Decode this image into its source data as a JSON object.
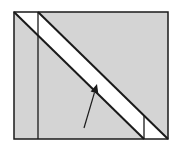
{
  "diagram": {
    "type": "geometry",
    "colors": {
      "background": "#ffffff",
      "shaded_region": "#d4d4d4",
      "band": "#ffffff",
      "stroke": "#1a1a1a"
    },
    "rectangle": {
      "x1": 14,
      "y1": 12,
      "x2": 168,
      "y2": 139
    },
    "band_lines": [
      {
        "x1": 14,
        "y1": 12,
        "x2": 144,
        "y2": 139
      },
      {
        "x1": 38,
        "y1": 12,
        "x2": 168,
        "y2": 139
      }
    ],
    "vertical_lines": [
      {
        "x": 38,
        "y1": 12,
        "y2": 139
      },
      {
        "x": 144,
        "y1": 116,
        "y2": 139
      }
    ],
    "arrow": {
      "x1": 84,
      "y1": 128,
      "x2": 97,
      "y2": 84
    }
  }
}
